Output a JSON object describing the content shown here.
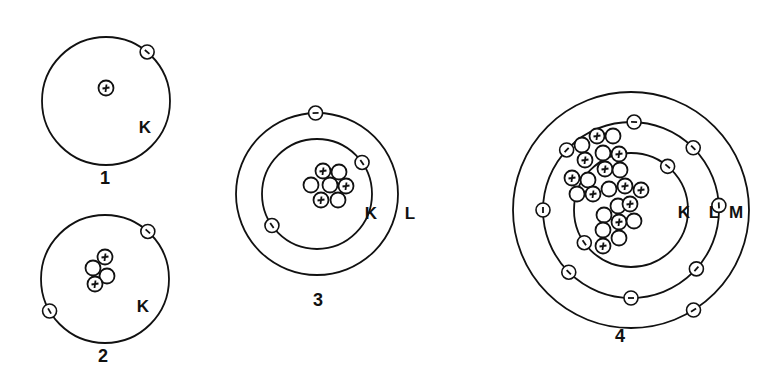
{
  "figure": {
    "colors": {
      "ink": "#111111",
      "background": "#ffffff"
    }
  },
  "atoms": [
    {
      "label": "1",
      "center": [
        106,
        101
      ],
      "shells": [
        {
          "name": "K",
          "radius": 64,
          "label_pos": [
            145,
            133
          ]
        }
      ],
      "label_pos": [
        105,
        184
      ],
      "protons": 1,
      "neutrons": 0,
      "electrons": [
        {
          "shell": 0,
          "angle": -50
        }
      ],
      "nucleus": [
        {
          "x": 106,
          "y": 88,
          "type": "proton"
        }
      ]
    },
    {
      "label": "2",
      "center": [
        105,
        279
      ],
      "shells": [
        {
          "name": "K",
          "radius": 64,
          "label_pos": [
            143,
            312
          ]
        }
      ],
      "label_pos": [
        103,
        362
      ],
      "protons": 2,
      "neutrons": 2,
      "electrons": [
        {
          "shell": 0,
          "angle": -48
        },
        {
          "shell": 0,
          "angle": 150
        }
      ],
      "nucleus": [
        {
          "x": 105,
          "y": 257,
          "type": "proton"
        },
        {
          "x": 93,
          "y": 268,
          "type": "neutron"
        },
        {
          "x": 107,
          "y": 276,
          "type": "neutron"
        },
        {
          "x": 95,
          "y": 284,
          "type": "proton"
        }
      ]
    },
    {
      "label": "3",
      "center": [
        317,
        194
      ],
      "shells": [
        {
          "name": "K",
          "radius": 55,
          "label_pos": [
            371,
            219
          ]
        },
        {
          "name": "L",
          "radius": 81,
          "label_pos": [
            410,
            219
          ]
        }
      ],
      "label_pos": [
        318,
        306
      ],
      "protons": 3,
      "neutrons": 4,
      "electrons": [
        {
          "shell": 0,
          "angle": -35
        },
        {
          "shell": 0,
          "angle": 145
        },
        {
          "shell": 1,
          "angle": -91
        }
      ],
      "nucleus": [
        {
          "x": 323,
          "y": 171,
          "type": "proton"
        },
        {
          "x": 339,
          "y": 172,
          "type": "neutron"
        },
        {
          "x": 311,
          "y": 185,
          "type": "neutron"
        },
        {
          "x": 330,
          "y": 185,
          "type": "neutron"
        },
        {
          "x": 346,
          "y": 186,
          "type": "proton"
        },
        {
          "x": 321,
          "y": 200,
          "type": "proton"
        },
        {
          "x": 338,
          "y": 200,
          "type": "neutron"
        }
      ]
    },
    {
      "label": "4",
      "center": [
        631,
        210
      ],
      "shells": [
        {
          "name": "K",
          "radius": 57,
          "label_pos": [
            684,
            218
          ]
        },
        {
          "name": "L",
          "radius": 88,
          "label_pos": [
            714,
            218
          ]
        },
        {
          "name": "M",
          "radius": 118,
          "label_pos": [
            736,
            218
          ]
        }
      ],
      "label_pos": [
        620,
        342
      ],
      "protons": 11,
      "neutrons": 12,
      "electrons": [
        {
          "shell": 0,
          "angle": -50
        },
        {
          "shell": 0,
          "angle": 145
        },
        {
          "shell": 1,
          "angle": -88
        },
        {
          "shell": 1,
          "angle": -45
        },
        {
          "shell": 1,
          "angle": -3
        },
        {
          "shell": 1,
          "angle": 42
        },
        {
          "shell": 1,
          "angle": 90
        },
        {
          "shell": 1,
          "angle": 135
        },
        {
          "shell": 1,
          "angle": 180
        },
        {
          "shell": 1,
          "angle": -137
        },
        {
          "shell": 2,
          "angle": 58
        }
      ],
      "nucleus": [
        {
          "x": 582,
          "y": 145,
          "type": "neutron"
        },
        {
          "x": 597,
          "y": 136,
          "type": "proton"
        },
        {
          "x": 613,
          "y": 136,
          "type": "neutron"
        },
        {
          "x": 585,
          "y": 160,
          "type": "proton"
        },
        {
          "x": 603,
          "y": 153,
          "type": "neutron"
        },
        {
          "x": 619,
          "y": 154,
          "type": "proton"
        },
        {
          "x": 605,
          "y": 169,
          "type": "proton"
        },
        {
          "x": 620,
          "y": 170,
          "type": "neutron"
        },
        {
          "x": 572,
          "y": 178,
          "type": "proton"
        },
        {
          "x": 588,
          "y": 180,
          "type": "neutron"
        },
        {
          "x": 577,
          "y": 194,
          "type": "neutron"
        },
        {
          "x": 593,
          "y": 194,
          "type": "proton"
        },
        {
          "x": 609,
          "y": 189,
          "type": "neutron"
        },
        {
          "x": 625,
          "y": 186,
          "type": "proton"
        },
        {
          "x": 641,
          "y": 190,
          "type": "proton"
        },
        {
          "x": 604,
          "y": 215,
          "type": "neutron"
        },
        {
          "x": 618,
          "y": 206,
          "type": "neutron"
        },
        {
          "x": 630,
          "y": 204,
          "type": "proton"
        },
        {
          "x": 619,
          "y": 222,
          "type": "proton"
        },
        {
          "x": 634,
          "y": 221,
          "type": "neutron"
        },
        {
          "x": 603,
          "y": 230,
          "type": "neutron"
        },
        {
          "x": 619,
          "y": 238,
          "type": "neutron"
        },
        {
          "x": 603,
          "y": 246,
          "type": "proton"
        }
      ]
    }
  ]
}
